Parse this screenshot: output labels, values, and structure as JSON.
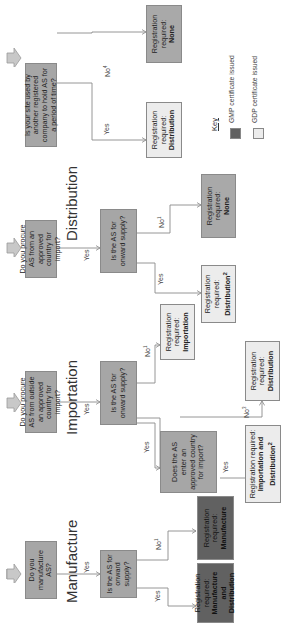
{
  "sections": {
    "manufacture": "Manufacture",
    "importation": "Importation",
    "distribution": "Distribution"
  },
  "questions": {
    "q_manufacture": "Do you manufacture AS?",
    "q_manufacture_onward": "Is the AS for onward supply?",
    "q_import": "Do you procure AS from outside an approved country for import?",
    "q_import_onward": "Is the AS for onward supply?",
    "q_import_enter": "Does the AS enter an approved country for import?",
    "q_distribution": "Do you procure AS from an approved country for import?",
    "q_distribution_onward": "Is the AS for onward supply?",
    "q_site": "Is your site used by another registered company to hold AS for a period of time?"
  },
  "results": {
    "prefix": "Registration required:",
    "mfg_and_dist": "Manufacture and Distribution",
    "mfg_only": "Manufacture",
    "imp_and_dist": "Importation and Distribution",
    "imp_and_dist_sup": "2",
    "imp_dist": "Distribution",
    "imp_only": "Importation",
    "dist_dist": "Distribution",
    "dist_dist_sup": "2",
    "dist_none": "None",
    "site_dist": "Distribution",
    "site_none": "None"
  },
  "edge_labels": {
    "yes": "Yes",
    "no": "No",
    "no_sup_1": "1",
    "no_sup_3": "3",
    "no_sup_4": "4"
  },
  "key": {
    "title": "Key",
    "gmp": "GMP certificate issued",
    "gdp": "GDP certificate issued",
    "gmp_color": "#616161",
    "gdp_color": "#ececec"
  },
  "colors": {
    "question": "#a6a6a6",
    "none_result": "#a9a9a9",
    "line": "#8a8a8a"
  }
}
